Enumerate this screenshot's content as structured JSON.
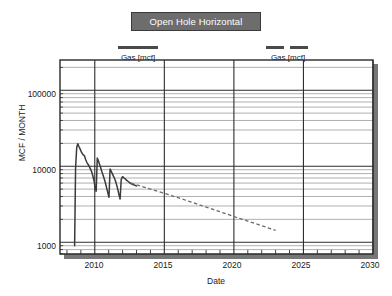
{
  "title": {
    "text": "Open Hole Horizontal"
  },
  "legends": [
    {
      "id": "legend-left",
      "label": "Gas [mcf]",
      "style": "solid",
      "color": "#4a4a4a"
    },
    {
      "id": "legend-right",
      "label": "Gas [mcf]",
      "style": "dashed",
      "color": "#4a4a4a"
    }
  ],
  "axes": {
    "ylabel": "MCF / MONTH",
    "xlabel": "Date",
    "ytick_labels": [
      "100000",
      "10000",
      "1000"
    ],
    "xtick_labels": [
      "2010",
      "2015",
      "2020",
      "2025",
      "2030"
    ]
  },
  "chart_data": {
    "type": "line",
    "title": "Open Hole Horizontal",
    "xlabel": "Date",
    "ylabel": "MCF / MONTH",
    "xlim": [
      2007.5,
      2030
    ],
    "ylim": [
      700,
      250000
    ],
    "yscale": "log",
    "xticks": [
      2010,
      2015,
      2020,
      2025,
      2030
    ],
    "yticks": [
      1000,
      10000,
      100000
    ],
    "grid": true,
    "grid_minor": true,
    "legend_position": "above-plot",
    "series": [
      {
        "name": "Gas [mcf]",
        "kind": "history",
        "style": "solid",
        "color": "#3a3a3a",
        "x": [
          2008.55,
          2008.62,
          2008.7,
          2008.78,
          2008.86,
          2008.95,
          2009.05,
          2009.15,
          2009.25,
          2009.35,
          2009.45,
          2009.55,
          2009.65,
          2009.75,
          2009.85,
          2009.95,
          2010.02,
          2010.1,
          2010.18,
          2010.26,
          2010.34,
          2010.42,
          2010.5,
          2010.58,
          2010.66,
          2010.75,
          2010.85,
          2010.95,
          2011.02,
          2011.1,
          2011.18,
          2011.26,
          2011.34,
          2011.42,
          2011.5,
          2011.58,
          2011.66,
          2011.74,
          2011.82,
          2011.9,
          2012.0,
          2012.1,
          2012.2,
          2012.3,
          2012.4,
          2012.5,
          2012.6,
          2012.7,
          2012.8,
          2012.9,
          2013.0
        ],
        "y": [
          900,
          9500,
          17500,
          19800,
          18200,
          16800,
          15200,
          14200,
          13800,
          12200,
          11000,
          10400,
          9500,
          8700,
          7600,
          6400,
          5200,
          4700,
          12800,
          11800,
          10600,
          9600,
          8600,
          7800,
          7000,
          6200,
          5200,
          4400,
          3900,
          9200,
          8600,
          8000,
          7400,
          6900,
          6300,
          5600,
          4900,
          4200,
          3700,
          6700,
          7300,
          7000,
          6800,
          6500,
          6300,
          6100,
          5900,
          5800,
          5700,
          5600,
          5500
        ]
      },
      {
        "name": "Gas [mcf]",
        "kind": "forecast",
        "style": "dashed",
        "color": "#6a6a6a",
        "x": [
          2012.6,
          2014.0,
          2015.0,
          2016.0,
          2017.0,
          2018.0,
          2019.0,
          2020.0,
          2021.0,
          2022.0,
          2023.0
        ],
        "y": [
          6000,
          5000,
          4400,
          3850,
          3350,
          2900,
          2520,
          2180,
          1900,
          1650,
          1430
        ]
      }
    ]
  }
}
